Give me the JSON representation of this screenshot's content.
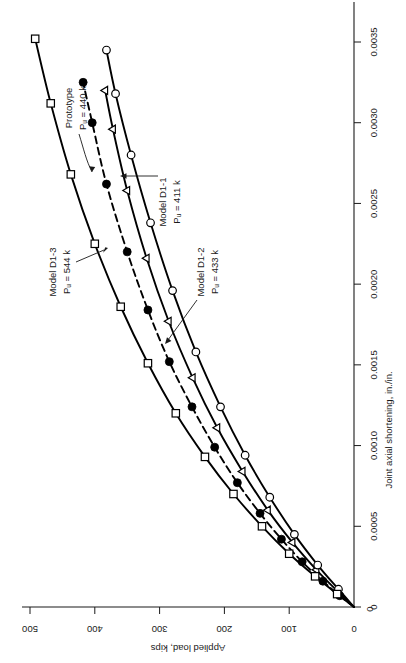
{
  "chart_data": {
    "type": "line",
    "title": "",
    "orientation_note": "figure rotated 90 degrees counter-clockwise on the page",
    "xlabel": "Joint axial shortening, in./in.",
    "ylabel": "Applied load, kips",
    "xlim": [
      0,
      0.0035
    ],
    "ylim": [
      0,
      500
    ],
    "grid": false,
    "legend": "none",
    "xticks": [
      {
        "value": 0,
        "label": "0"
      },
      {
        "value": 0.0005,
        "label": "0.0005"
      },
      {
        "value": 0.001,
        "label": "0.0010"
      },
      {
        "value": 0.0015,
        "label": "0.0015"
      },
      {
        "value": 0.002,
        "label": "0.0020"
      },
      {
        "value": 0.0025,
        "label": "0.0025"
      },
      {
        "value": 0.003,
        "label": "0.0030"
      },
      {
        "value": 0.0035,
        "label": "0.0035"
      }
    ],
    "yticks": [
      {
        "value": 0,
        "label": "0"
      },
      {
        "value": 100,
        "label": "100"
      },
      {
        "value": 200,
        "label": "200"
      },
      {
        "value": 300,
        "label": "300"
      },
      {
        "value": 400,
        "label": "400"
      },
      {
        "value": 500,
        "label": "500"
      }
    ],
    "series": [
      {
        "name": "Prototype",
        "marker": "filled-circle",
        "line": "dashed",
        "annotation": "Prototype",
        "annotation_sub": "Pᵤ = 440 k",
        "ultimate_load_kips": 440,
        "points": [
          {
            "x": 0.0,
            "y": 0
          },
          {
            "x": 7e-05,
            "y": 22
          },
          {
            "x": 0.00016,
            "y": 48
          },
          {
            "x": 0.00028,
            "y": 80
          },
          {
            "x": 0.00042,
            "y": 112
          },
          {
            "x": 0.00058,
            "y": 145
          },
          {
            "x": 0.00077,
            "y": 180
          },
          {
            "x": 0.00099,
            "y": 215
          },
          {
            "x": 0.00124,
            "y": 250
          },
          {
            "x": 0.00152,
            "y": 285
          },
          {
            "x": 0.00184,
            "y": 318
          },
          {
            "x": 0.0022,
            "y": 350
          },
          {
            "x": 0.00262,
            "y": 382
          },
          {
            "x": 0.003,
            "y": 404
          },
          {
            "x": 0.00325,
            "y": 418
          }
        ]
      },
      {
        "name": "Model D1-1",
        "marker": "open-triangle",
        "line": "solid",
        "annotation": "Model D1-1",
        "annotation_sub": "Pᵤ = 411 k",
        "ultimate_load_kips": 411,
        "points": [
          {
            "x": 0.0,
            "y": 0
          },
          {
            "x": 0.0001,
            "y": 26
          },
          {
            "x": 0.00023,
            "y": 58
          },
          {
            "x": 0.0004,
            "y": 95
          },
          {
            "x": 0.0006,
            "y": 133
          },
          {
            "x": 0.00084,
            "y": 172
          },
          {
            "x": 0.00111,
            "y": 211
          },
          {
            "x": 0.00142,
            "y": 249
          },
          {
            "x": 0.00177,
            "y": 286
          },
          {
            "x": 0.00216,
            "y": 320
          },
          {
            "x": 0.00258,
            "y": 350
          },
          {
            "x": 0.00296,
            "y": 372
          },
          {
            "x": 0.0032,
            "y": 384
          }
        ]
      },
      {
        "name": "Model D1-2",
        "marker": "open-circle",
        "line": "solid",
        "annotation": "Model D1-2",
        "annotation_sub": "Pᵤ = 433 k",
        "ultimate_load_kips": 433,
        "points": [
          {
            "x": 0.0,
            "y": 0
          },
          {
            "x": 0.00011,
            "y": 24
          },
          {
            "x": 0.00026,
            "y": 56
          },
          {
            "x": 0.00045,
            "y": 92
          },
          {
            "x": 0.00068,
            "y": 130
          },
          {
            "x": 0.00094,
            "y": 168
          },
          {
            "x": 0.00124,
            "y": 206
          },
          {
            "x": 0.00158,
            "y": 244
          },
          {
            "x": 0.00196,
            "y": 280
          },
          {
            "x": 0.00238,
            "y": 314
          },
          {
            "x": 0.0028,
            "y": 344
          },
          {
            "x": 0.00318,
            "y": 368
          },
          {
            "x": 0.00345,
            "y": 382
          }
        ]
      },
      {
        "name": "Model D1-3",
        "marker": "open-square",
        "line": "solid",
        "annotation": "Model D1-3",
        "annotation_sub": "Pᵤ = 544 k",
        "ultimate_load_kips": 544,
        "points": [
          {
            "x": 0.0,
            "y": 0
          },
          {
            "x": 8e-05,
            "y": 26
          },
          {
            "x": 0.00019,
            "y": 60
          },
          {
            "x": 0.00033,
            "y": 100
          },
          {
            "x": 0.0005,
            "y": 142
          },
          {
            "x": 0.0007,
            "y": 186
          },
          {
            "x": 0.00093,
            "y": 230
          },
          {
            "x": 0.0012,
            "y": 275
          },
          {
            "x": 0.00151,
            "y": 318
          },
          {
            "x": 0.00186,
            "y": 360
          },
          {
            "x": 0.00225,
            "y": 400
          },
          {
            "x": 0.00268,
            "y": 437
          },
          {
            "x": 0.00312,
            "y": 468
          },
          {
            "x": 0.00352,
            "y": 492
          }
        ]
      }
    ],
    "annotations": [
      {
        "id": "proto",
        "label": "Prototype",
        "sub": "Pᵤ = 440 k"
      },
      {
        "id": "d1-1",
        "label": "Model D1-1",
        "sub": "Pᵤ = 411 k"
      },
      {
        "id": "d1-2",
        "label": "Model D1-2",
        "sub": "Pᵤ = 433 k"
      },
      {
        "id": "d1-3",
        "label": "Model D1-3",
        "sub": "Pᵤ = 544 k"
      }
    ],
    "colors": {
      "axis": "#1a1a1a",
      "curve": "#000000",
      "marker_fill": "#000000",
      "marker_open": "#ffffff",
      "background": "#ffffff"
    }
  }
}
